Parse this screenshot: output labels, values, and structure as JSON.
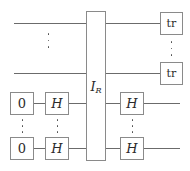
{
  "diagram": {
    "type": "quantum-circuit",
    "canvas": {
      "width": 190,
      "height": 171
    },
    "colors": {
      "wire": "#6b6b6b",
      "gate_border": "#8a8a8a",
      "gate_fill": "#ffffff",
      "text": "#2b2b2b",
      "background": "#ffffff"
    },
    "central_gate": {
      "label_main": "I",
      "label_sub": "R",
      "x": 86,
      "y": 11,
      "width": 20,
      "height": 150
    },
    "gates": {
      "zero_top": {
        "label": "0",
        "x": 10,
        "y": 92,
        "width": 24,
        "height": 23
      },
      "zero_bottom": {
        "label": "0",
        "x": 10,
        "y": 137,
        "width": 24,
        "height": 23
      },
      "h_left_top": {
        "label": "H",
        "x": 45,
        "y": 92,
        "width": 24,
        "height": 23
      },
      "h_left_bottom": {
        "label": "H",
        "x": 45,
        "y": 137,
        "width": 24,
        "height": 23
      },
      "h_right_top": {
        "label": "H",
        "x": 120,
        "y": 92,
        "width": 24,
        "height": 23
      },
      "h_right_bottom": {
        "label": "H",
        "x": 120,
        "y": 137,
        "width": 24,
        "height": 23
      },
      "tr_top": {
        "label": "tr",
        "x": 160,
        "y": 12,
        "width": 23,
        "height": 23
      },
      "tr_bottom": {
        "label": "tr",
        "x": 160,
        "y": 62,
        "width": 23,
        "height": 23
      }
    },
    "wires": {
      "rail_1_y": 23,
      "rail_2_y": 73,
      "rail_3_y": 103,
      "rail_4_y": 148
    },
    "ellipses": {
      "count": 5,
      "symbol": "vertical-ellipsis",
      "positions": [
        {
          "name": "upper-rails",
          "x": 48,
          "y": 40
        },
        {
          "name": "tr-column",
          "x": 171,
          "y": 42
        },
        {
          "name": "zero-column",
          "x": 22,
          "y": 120
        },
        {
          "name": "h-left-column",
          "x": 57,
          "y": 120
        },
        {
          "name": "h-right-column",
          "x": 132,
          "y": 120
        }
      ]
    }
  }
}
